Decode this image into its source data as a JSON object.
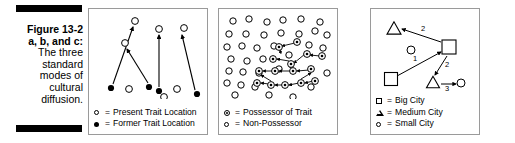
{
  "caption": {
    "figure_label": "Figure 13-2",
    "figure_sublabel": "a, b, and c:",
    "line1": "The three",
    "line2": "standard",
    "line3": "modes of",
    "line4": "cultural",
    "line5": "diffusion."
  },
  "panels": [
    {
      "id": "panel-a",
      "name": "relocation-diffusion",
      "legend": [
        {
          "glyph": "open-circle",
          "eq": "=",
          "label": "Present Trait Location"
        },
        {
          "glyph": "filled-circle",
          "eq": "=",
          "label": "Former Trait Location"
        }
      ],
      "markers": {
        "present": [
          {
            "x": 46,
            "y": 12
          },
          {
            "x": 36,
            "y": 34
          },
          {
            "x": 70,
            "y": 20
          },
          {
            "x": 95,
            "y": 19
          },
          {
            "x": 40,
            "y": 80
          },
          {
            "x": 88,
            "y": 80
          },
          {
            "x": 75,
            "y": 88
          }
        ],
        "former": [
          {
            "x": 22,
            "y": 79
          },
          {
            "x": 60,
            "y": 78
          },
          {
            "x": 70,
            "y": 82
          },
          {
            "x": 108,
            "y": 85
          }
        ]
      },
      "arrows": [
        {
          "x1": 24,
          "y1": 75,
          "x2": 44,
          "y2": 18
        },
        {
          "x1": 59,
          "y1": 74,
          "x2": 38,
          "y2": 40
        },
        {
          "x1": 70,
          "y1": 78,
          "x2": 70,
          "y2": 26
        },
        {
          "x1": 106,
          "y1": 81,
          "x2": 93,
          "y2": 26
        }
      ]
    },
    {
      "id": "panel-b",
      "name": "contagious-diffusion",
      "legend": [
        {
          "glyph": "possessor",
          "eq": "=",
          "label": "Possessor of Trait"
        },
        {
          "glyph": "open-circle",
          "eq": "=",
          "label": "Non-Possessor"
        }
      ],
      "markers": {
        "non_possessor": [
          {
            "x": 14,
            "y": 12
          },
          {
            "x": 30,
            "y": 10
          },
          {
            "x": 48,
            "y": 13
          },
          {
            "x": 64,
            "y": 11
          },
          {
            "x": 82,
            "y": 10
          },
          {
            "x": 101,
            "y": 13
          },
          {
            "x": 10,
            "y": 25
          },
          {
            "x": 27,
            "y": 25
          },
          {
            "x": 45,
            "y": 26
          },
          {
            "x": 62,
            "y": 24
          },
          {
            "x": 80,
            "y": 25
          },
          {
            "x": 96,
            "y": 22
          },
          {
            "x": 108,
            "y": 26
          },
          {
            "x": 8,
            "y": 38
          },
          {
            "x": 23,
            "y": 37
          },
          {
            "x": 38,
            "y": 39
          },
          {
            "x": 55,
            "y": 37
          },
          {
            "x": 90,
            "y": 36
          },
          {
            "x": 104,
            "y": 39
          },
          {
            "x": 12,
            "y": 50
          },
          {
            "x": 28,
            "y": 52
          },
          {
            "x": 44,
            "y": 50
          },
          {
            "x": 10,
            "y": 62
          },
          {
            "x": 24,
            "y": 63
          },
          {
            "x": 40,
            "y": 64
          },
          {
            "x": 8,
            "y": 74
          },
          {
            "x": 22,
            "y": 76
          },
          {
            "x": 36,
            "y": 78
          },
          {
            "x": 16,
            "y": 86
          },
          {
            "x": 50,
            "y": 86
          },
          {
            "x": 74,
            "y": 88
          },
          {
            "x": 92,
            "y": 78
          },
          {
            "x": 108,
            "y": 64
          },
          {
            "x": 60,
            "y": 60
          },
          {
            "x": 70,
            "y": 46
          }
        ],
        "possessor": [
          {
            "x": 60,
            "y": 38
          },
          {
            "x": 78,
            "y": 33
          },
          {
            "x": 54,
            "y": 50
          },
          {
            "x": 72,
            "y": 55
          },
          {
            "x": 88,
            "y": 45
          },
          {
            "x": 103,
            "y": 47
          },
          {
            "x": 40,
            "y": 62
          },
          {
            "x": 56,
            "y": 62
          },
          {
            "x": 74,
            "y": 62
          },
          {
            "x": 92,
            "y": 60
          },
          {
            "x": 38,
            "y": 74
          },
          {
            "x": 52,
            "y": 76
          },
          {
            "x": 66,
            "y": 76
          },
          {
            "x": 82,
            "y": 74
          },
          {
            "x": 96,
            "y": 72
          }
        ]
      },
      "arrows": [
        {
          "x1": 76,
          "y1": 34,
          "x2": 63,
          "y2": 37
        },
        {
          "x1": 62,
          "y1": 45,
          "x2": 61,
          "y2": 41
        },
        {
          "x1": 70,
          "y1": 52,
          "x2": 58,
          "y2": 50
        },
        {
          "x1": 86,
          "y1": 45,
          "x2": 75,
          "y2": 54
        },
        {
          "x1": 101,
          "y1": 47,
          "x2": 91,
          "y2": 46
        },
        {
          "x1": 72,
          "y1": 58,
          "x2": 72,
          "y2": 56
        },
        {
          "x1": 54,
          "y1": 62,
          "x2": 44,
          "y2": 62
        },
        {
          "x1": 72,
          "y1": 62,
          "x2": 60,
          "y2": 62
        },
        {
          "x1": 90,
          "y1": 61,
          "x2": 78,
          "y2": 62
        },
        {
          "x1": 50,
          "y1": 75,
          "x2": 42,
          "y2": 74
        },
        {
          "x1": 64,
          "y1": 76,
          "x2": 56,
          "y2": 76
        },
        {
          "x1": 80,
          "y1": 74,
          "x2": 70,
          "y2": 76
        },
        {
          "x1": 94,
          "y1": 72,
          "x2": 86,
          "y2": 74
        },
        {
          "x1": 52,
          "y1": 72,
          "x2": 42,
          "y2": 66
        },
        {
          "x1": 82,
          "y1": 70,
          "x2": 92,
          "y2": 64
        }
      ]
    },
    {
      "id": "panel-c",
      "name": "hierarchical-diffusion",
      "legend": [
        {
          "glyph": "square",
          "eq": "=",
          "label": "Big City"
        },
        {
          "glyph": "triangle",
          "eq": "=",
          "label": "Medium City"
        },
        {
          "glyph": "open-circle",
          "eq": "=",
          "label": "Small City"
        }
      ],
      "cities": {
        "big": [
          {
            "x": 78,
            "y": 38,
            "size": 14
          },
          {
            "x": 20,
            "y": 70,
            "size": 13
          }
        ],
        "medium": [
          {
            "x": 23,
            "y": 19,
            "size": 14
          },
          {
            "x": 62,
            "y": 73,
            "size": 13
          }
        ],
        "small": [
          {
            "x": 40,
            "y": 41,
            "r": 4
          },
          {
            "x": 90,
            "y": 74,
            "r": 4
          }
        ]
      },
      "arrows": [
        {
          "x1": 70,
          "y1": 33,
          "x2": 31,
          "y2": 20,
          "label": "2",
          "lx": 52,
          "ly": 22
        },
        {
          "x1": 26,
          "y1": 67,
          "x2": 70,
          "y2": 43,
          "label": "1",
          "lx": 44,
          "ly": 52
        },
        {
          "x1": 76,
          "y1": 47,
          "x2": 64,
          "y2": 66,
          "label": "2",
          "lx": 76,
          "ly": 58
        },
        {
          "x1": 70,
          "y1": 75,
          "x2": 85,
          "y2": 75,
          "label": "3",
          "lx": 76,
          "ly": 82
        }
      ]
    }
  ]
}
